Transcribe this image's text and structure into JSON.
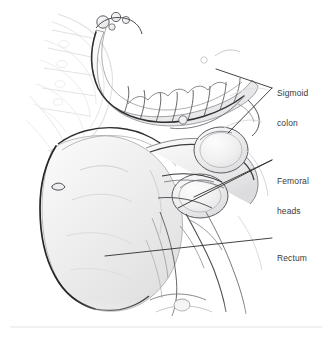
{
  "figure": {
    "kind": "anatomical-illustration",
    "background_color": "#ffffff",
    "ink_color": "#4a4a4a",
    "outline_color": "#2b2b2b",
    "label_text_color": "#3a3a3a",
    "leader_line_color": "#2e2e2e",
    "divider_color": "#e3e3e3"
  },
  "annotations": [
    {
      "id": "sigmoid-colon",
      "line1": "Sigmoid",
      "line2": "colon",
      "full": "Sigmoid colon",
      "leader_style": "bracket-two-lines"
    },
    {
      "id": "femoral-heads",
      "line1": "Femoral",
      "line2": "heads",
      "full": "Femoral heads",
      "leader_style": "bracket-two-lines"
    },
    {
      "id": "rectum",
      "line1": "Rectum",
      "line2": "",
      "full": "Rectum",
      "leader_style": "single-line"
    }
  ],
  "divider": {
    "present": "true",
    "orientation": "horizontal"
  }
}
